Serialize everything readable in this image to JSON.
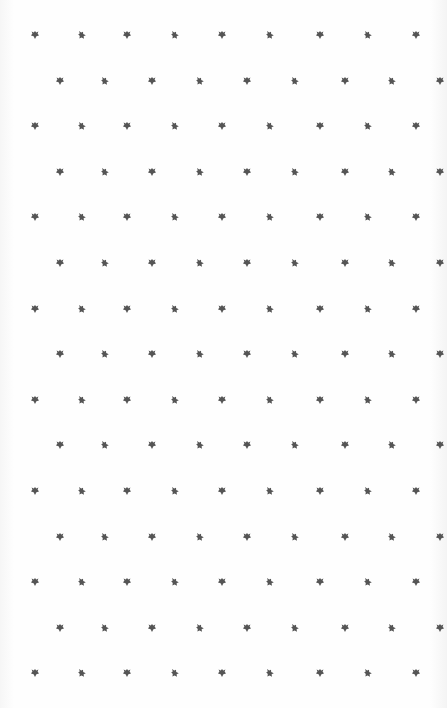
{
  "pattern": {
    "background": "#fefefe",
    "mark_color": "#555555",
    "row_start_y": 35,
    "row_spacing": 45.6,
    "rows": 15,
    "odd_row_x": [
      35,
      82,
      127,
      175,
      222,
      270,
      320,
      368,
      416
    ],
    "even_row_x": [
      60,
      105,
      152,
      200,
      247,
      295,
      345,
      392,
      440
    ],
    "mark_types": [
      "clover-icon",
      "tilted-clover-icon"
    ]
  }
}
